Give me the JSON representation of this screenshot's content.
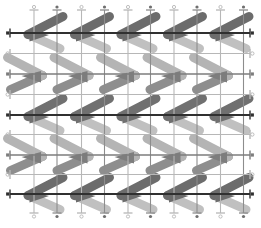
{
  "figure": {
    "width": 261,
    "height": 228,
    "background": "#ffffff",
    "columns": 5,
    "column_pitch": 46.5,
    "vertical_lines": {
      "y_top": 10,
      "y_bottom": 213,
      "cap_half": 4.5,
      "marker_radius": 1.6,
      "line_width": 1.1,
      "xs": [
        34,
        57,
        81.5,
        104.5,
        128,
        150.5,
        174,
        197,
        220.5,
        243.5
      ],
      "styles": [
        "light",
        "dark",
        "light",
        "dark",
        "light",
        "dark",
        "light",
        "dark",
        "light",
        "dark"
      ],
      "colors": {
        "light": "#b7b7b7",
        "dark": "#8d8d8d"
      },
      "marker_fill_dark": "#6f6f6f"
    },
    "horizontal_lines": {
      "x_left": 10,
      "x_right": 250,
      "cap_half": 4.5,
      "marker_radius": 1.7,
      "marker_square": 3.2,
      "ys": [
        33,
        53.5,
        74,
        94.5,
        115,
        134.5,
        155,
        174.5,
        194
      ],
      "styles": [
        "strong",
        "faint",
        "medium",
        "faint",
        "strong",
        "faint",
        "medium",
        "faint",
        "strong"
      ],
      "colors": {
        "strong": "#303030",
        "medium": "#7d7d7d",
        "faint": "#b7b7b7"
      },
      "widths": {
        "strong": 1.9,
        "medium": 1.7,
        "faint": 1.0
      }
    },
    "glyphs": {
      "limb_width": 9,
      "top_limb": [
        35,
        -18
      ],
      "bottom_limb": [
        32,
        14
      ],
      "wedge": [
        [
          1.5,
          -4.5
        ],
        [
          21,
          0.5
        ],
        [
          1.5,
          7
        ]
      ],
      "tip_y_offset": 1.5,
      "rows": [
        {
          "y": 33,
          "direction": "left",
          "tip_x": 28,
          "top_color": "#6c6c6c",
          "bottom_color": "#c0c0c0",
          "wedge_color": "#6c6c6c"
        },
        {
          "y": 74,
          "direction": "right",
          "tip_x": 42.5,
          "top_color": "#b4b4b4",
          "bottom_color": "#8e8e8e",
          "wedge_color": "#7d7d7d"
        },
        {
          "y": 115,
          "direction": "left",
          "tip_x": 28,
          "top_color": "#707070",
          "bottom_color": "#c0c0c0",
          "wedge_color": "#707070"
        },
        {
          "y": 155,
          "direction": "right",
          "tip_x": 42.5,
          "top_color": "#b4b4b4",
          "bottom_color": "#8e8e8e",
          "wedge_color": "#7d7d7d"
        },
        {
          "y": 194,
          "direction": "left",
          "tip_x": 28,
          "top_color": "#6c6c6c",
          "bottom_color": "#c0c0c0",
          "wedge_color": "#6c6c6c"
        }
      ]
    }
  }
}
